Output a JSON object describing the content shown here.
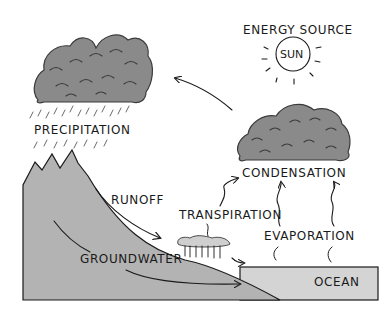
{
  "labels": {
    "energy_source": "ENERGY SOURCE",
    "sun": "SUN",
    "precipitation": "PRECIPITATION",
    "condensation": "CONDENSATION",
    "runoff": "RUNOFF",
    "transpiration": "TRANSPIRATION",
    "evaporation": "EVAPORATION",
    "groundwater": "GROUNDWATER",
    "ocean": "OCEAN"
  },
  "colors": {
    "land": "#b3b3b3",
    "ocean": "#d4d4d4",
    "cloud": "#8a8a8a",
    "ink": "#1a1a1a"
  }
}
